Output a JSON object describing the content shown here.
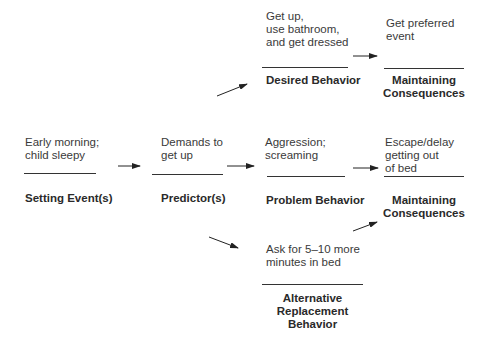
{
  "diagram": {
    "type": "competing-behavior-pathway",
    "nodes": {
      "setting_event": {
        "text": "Early morning;\nchild sleepy",
        "label": "Setting Event(s)"
      },
      "predictor": {
        "text": "Demands to\nget up",
        "label": "Predictor(s)"
      },
      "desired_behavior": {
        "text": "Get up,\nuse bathroom,\nand get dressed",
        "label": "Desired Behavior"
      },
      "desired_consequence": {
        "text": "Get preferred\nevent",
        "label": "Maintaining\nConsequences"
      },
      "problem_behavior": {
        "text": "Aggression;\nscreaming",
        "label": "Problem Behavior"
      },
      "problem_consequence": {
        "text": "Escape/delay\ngetting out\nof bed",
        "label": "Maintaining\nConsequences"
      },
      "alternative_behavior": {
        "text": "Ask for 5–10 more\nminutes in bed",
        "label": "Alternative\nReplacement\nBehavior"
      }
    },
    "edges": [
      {
        "from": "setting_event",
        "to": "predictor"
      },
      {
        "from": "predictor",
        "to": "problem_behavior"
      },
      {
        "from": "predictor",
        "to": "desired_behavior"
      },
      {
        "from": "predictor",
        "to": "alternative_behavior"
      },
      {
        "from": "desired_behavior",
        "to": "desired_consequence"
      },
      {
        "from": "problem_behavior",
        "to": "problem_consequence"
      },
      {
        "from": "alternative_behavior",
        "to": "problem_consequence"
      }
    ],
    "colors": {
      "line": "#333333",
      "text": "#3a3a3a",
      "label": "#2a2a2a"
    }
  }
}
